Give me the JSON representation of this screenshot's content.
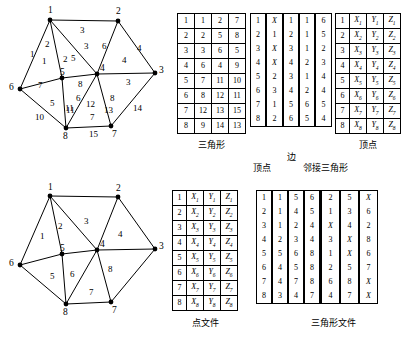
{
  "figure": {
    "top_graph": {
      "name": "triangulation-with-edge-numbers",
      "vertices": [
        {
          "id": "1",
          "label": "1",
          "x": 50,
          "y": 20,
          "lx": 48,
          "ly": 6
        },
        {
          "id": "2",
          "label": "2",
          "x": 118,
          "y": 21,
          "lx": 116,
          "ly": 7
        },
        {
          "id": "3",
          "label": "3",
          "x": 155,
          "y": 73,
          "lx": 159,
          "ly": 66
        },
        {
          "id": "4",
          "label": "4",
          "x": 97,
          "y": 74,
          "lx": 100,
          "ly": 64
        },
        {
          "id": "5",
          "label": "5",
          "x": 62,
          "y": 78,
          "lx": 60,
          "ly": 68
        },
        {
          "id": "6",
          "label": "6",
          "x": 20,
          "y": 89,
          "lx": 9,
          "ly": 83
        },
        {
          "id": "7",
          "label": "7",
          "x": 111,
          "y": 126,
          "lx": 112,
          "ly": 130
        },
        {
          "id": "8",
          "label": "8",
          "x": 66,
          "y": 128,
          "lx": 63,
          "ly": 132
        }
      ],
      "edges": [
        {
          "from": "1",
          "to": "2",
          "label": "3",
          "lx": 80,
          "ly": 26
        },
        {
          "from": "1",
          "to": "5",
          "label": "2",
          "lx": 45,
          "ly": 40
        },
        {
          "from": "1",
          "to": "6",
          "label": "1",
          "lx": 30,
          "ly": 50
        },
        {
          "from": "1",
          "to": "4",
          "label": "3",
          "lx": 84,
          "ly": 42
        },
        {
          "from": "2",
          "to": "4",
          "label": "6",
          "lx": 102,
          "ly": 42
        },
        {
          "from": "2",
          "to": "3",
          "label": "4",
          "lx": 137,
          "ly": 44
        },
        {
          "from": "3",
          "to": "4",
          "label": "3",
          "lx": 126,
          "ly": 78
        },
        {
          "from": "3",
          "to": "7",
          "label": "14",
          "lx": 133,
          "ly": 104
        },
        {
          "from": "4",
          "to": "5",
          "label": "8",
          "lx": 78,
          "ly": 80
        },
        {
          "from": "4",
          "to": "7",
          "label": "8",
          "lx": 110,
          "ly": 94
        },
        {
          "from": "4",
          "to": "8",
          "label": "12",
          "lx": 86,
          "ly": 100
        },
        {
          "from": "5",
          "to": "6",
          "label": "7",
          "lx": 38,
          "ly": 81
        },
        {
          "from": "5",
          "to": "8",
          "label": "11",
          "lx": 65,
          "ly": 104
        },
        {
          "from": "6",
          "to": "8",
          "label": "10",
          "lx": 35,
          "ly": 113
        },
        {
          "from": "7",
          "to": "8",
          "label": "15",
          "lx": 89,
          "ly": 130
        }
      ],
      "face_labels": [
        {
          "label": "1",
          "lx": 42,
          "ly": 57
        },
        {
          "label": "2",
          "lx": 63,
          "ly": 55
        },
        {
          "label": "5",
          "lx": 71,
          "ly": 54
        },
        {
          "label": "4",
          "lx": 122,
          "ly": 56
        },
        {
          "label": "5",
          "lx": 50,
          "ly": 99
        },
        {
          "label": "6",
          "lx": 76,
          "ly": 94
        },
        {
          "label": "11",
          "lx": 66,
          "ly": 106
        },
        {
          "label": "13",
          "lx": 104,
          "ly": 106
        },
        {
          "label": "7",
          "lx": 90,
          "ly": 113
        }
      ]
    },
    "bottom_graph": {
      "name": "triangulation-with-triangle-numbers",
      "vertices": [
        {
          "id": "1",
          "label": "1",
          "x": 50,
          "y": 196,
          "lx": 48,
          "ly": 183
        },
        {
          "id": "2",
          "label": "2",
          "x": 118,
          "y": 197,
          "lx": 116,
          "ly": 184
        },
        {
          "id": "3",
          "label": "3",
          "x": 155,
          "y": 249,
          "lx": 159,
          "ly": 242
        },
        {
          "id": "4",
          "label": "4",
          "x": 97,
          "y": 250,
          "lx": 100,
          "ly": 240
        },
        {
          "id": "5",
          "label": "5",
          "x": 62,
          "y": 254,
          "lx": 60,
          "ly": 244
        },
        {
          "id": "6",
          "label": "6",
          "x": 20,
          "y": 265,
          "lx": 9,
          "ly": 259
        },
        {
          "id": "7",
          "label": "7",
          "x": 111,
          "y": 302,
          "lx": 112,
          "ly": 306
        },
        {
          "id": "8",
          "label": "8",
          "x": 66,
          "y": 304,
          "lx": 63,
          "ly": 308
        }
      ],
      "edges": [
        {
          "from": "1",
          "to": "2"
        },
        {
          "from": "1",
          "to": "5"
        },
        {
          "from": "1",
          "to": "6"
        },
        {
          "from": "1",
          "to": "4"
        },
        {
          "from": "2",
          "to": "4"
        },
        {
          "from": "2",
          "to": "3"
        },
        {
          "from": "3",
          "to": "4"
        },
        {
          "from": "3",
          "to": "7"
        },
        {
          "from": "4",
          "to": "5"
        },
        {
          "from": "4",
          "to": "7"
        },
        {
          "from": "4",
          "to": "8"
        },
        {
          "from": "5",
          "to": "6"
        },
        {
          "from": "5",
          "to": "8"
        },
        {
          "from": "6",
          "to": "8"
        },
        {
          "from": "7",
          "to": "8"
        }
      ],
      "face_labels": [
        {
          "label": "1",
          "lx": 40,
          "ly": 232
        },
        {
          "label": "2",
          "lx": 58,
          "ly": 222
        },
        {
          "label": "3",
          "lx": 84,
          "ly": 217
        },
        {
          "label": "4",
          "lx": 118,
          "ly": 230
        },
        {
          "label": "5",
          "lx": 50,
          "ly": 272
        },
        {
          "label": "6",
          "lx": 70,
          "ly": 270
        },
        {
          "label": "7",
          "lx": 89,
          "ly": 288
        },
        {
          "label": "8",
          "lx": 108,
          "ly": 265
        }
      ]
    }
  },
  "tables": {
    "triangle_top": {
      "caption": "三角形",
      "rows": [
        [
          "1",
          "1",
          "2",
          "7"
        ],
        [
          "2",
          "2",
          "5",
          "8"
        ],
        [
          "3",
          "3",
          "6",
          "5"
        ],
        [
          "4",
          "6",
          "4",
          "9"
        ],
        [
          "5",
          "7",
          "11",
          "10"
        ],
        [
          "6",
          "8",
          "12",
          "11"
        ],
        [
          "7",
          "12",
          "13",
          "15"
        ],
        [
          "8",
          "9",
          "14",
          "13"
        ]
      ]
    },
    "edge_top": {
      "caption": "边",
      "sub_caption_left": "顶点",
      "sub_caption_right": "邻接三角形",
      "rows": [
        [
          "1",
          "X",
          "1",
          "1",
          "6"
        ],
        [
          "2",
          "1",
          "2",
          "1",
          "5"
        ],
        [
          "3",
          "X",
          "3",
          "1",
          "2"
        ],
        [
          "4",
          "X",
          "4",
          "2",
          "3"
        ],
        [
          "5",
          "2",
          "3",
          "1",
          "4"
        ],
        [
          "6",
          "3",
          "4",
          "2",
          "4"
        ],
        [
          "7",
          "1",
          "5",
          "6",
          "5"
        ],
        [
          "8",
          "2",
          "6",
          "5",
          "4"
        ]
      ],
      "italic_cells": [
        "X"
      ]
    },
    "vertex_top": {
      "caption": "顶点",
      "rows": [
        [
          "1",
          "X",
          "Y",
          "Z",
          "1"
        ],
        [
          "2",
          "X",
          "Y",
          "Z",
          "2"
        ],
        [
          "3",
          "X",
          "Y",
          "Z",
          "3"
        ],
        [
          "4",
          "X",
          "Y",
          "Z",
          "4"
        ],
        [
          "5",
          "X",
          "Y",
          "Z",
          "5"
        ],
        [
          "6",
          "X",
          "Y",
          "Z",
          "6"
        ],
        [
          "7",
          "X",
          "Y",
          "Z",
          "7"
        ],
        [
          "8",
          "X",
          "Y",
          "Z",
          "8"
        ]
      ]
    },
    "point_file": {
      "caption": "点文件",
      "rows": [
        [
          "1",
          "X",
          "Y",
          "Z",
          "1"
        ],
        [
          "2",
          "X",
          "Y",
          "Z",
          "2"
        ],
        [
          "3",
          "X",
          "Y",
          "Z",
          "3"
        ],
        [
          "4",
          "X",
          "Y",
          "Z",
          "4"
        ],
        [
          "5",
          "X",
          "Y",
          "Z",
          "5"
        ],
        [
          "6",
          "X",
          "Y",
          "Z",
          "6"
        ],
        [
          "7",
          "X",
          "Y",
          "Z",
          "7"
        ],
        [
          "8",
          "X",
          "Y",
          "Z",
          "8"
        ]
      ]
    },
    "triangle_file": {
      "caption": "三角形文件",
      "left_rows": [
        [
          "1",
          "1",
          "5",
          "6"
        ],
        [
          "2",
          "1",
          "4",
          "5"
        ],
        [
          "3",
          "1",
          "2",
          "4"
        ],
        [
          "4",
          "2",
          "3",
          "4"
        ],
        [
          "5",
          "5",
          "6",
          "8"
        ],
        [
          "6",
          "4",
          "5",
          "8"
        ],
        [
          "7",
          "4",
          "7",
          "8"
        ],
        [
          "8",
          "3",
          "4",
          "7"
        ]
      ],
      "right_rows": [
        [
          "2",
          "5",
          "X"
        ],
        [
          "1",
          "3",
          "6"
        ],
        [
          "X",
          "4",
          "2"
        ],
        [
          "3",
          "X",
          "8"
        ],
        [
          "1",
          "X",
          "6"
        ],
        [
          "2",
          "5",
          "7"
        ],
        [
          "6",
          "8",
          "X"
        ],
        [
          "4",
          "7",
          "X"
        ]
      ]
    }
  }
}
